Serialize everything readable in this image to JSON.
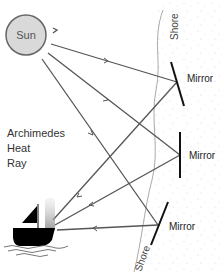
{
  "diagram": {
    "title": "Archimedes Heat Ray",
    "title_lines": [
      "Archimedes",
      "Heat",
      "Ray"
    ],
    "sun_label": "Sun",
    "shore_label_top": "Shore",
    "shore_label_bottom": "Shore",
    "mirrors": [
      {
        "label": "Mirror"
      },
      {
        "label": "Mirror"
      },
      {
        "label": "Mirror"
      }
    ],
    "colors": {
      "sun_fill": "#d9d9d9",
      "sun_stroke": "#666666",
      "ray": "#555555",
      "mirror": "#111111",
      "shore_line": "#aaaaaa",
      "boat": "#000000",
      "text": "#333333"
    }
  }
}
